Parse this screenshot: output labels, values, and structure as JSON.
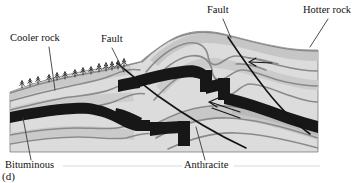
{
  "figure": {
    "panel_id": "(d)",
    "width": 363,
    "height": 183,
    "background": "#ffffff"
  },
  "labels": {
    "cooler_rock": "Cooler rock",
    "fault_left": "Fault",
    "fault_top": "Fault",
    "hotter_rock": "Hotter rock",
    "bituminous": "Bituminous",
    "anthracite": "Anthracite"
  },
  "colors": {
    "coal_seam": "#171717",
    "rock_light": "#dcdcdc",
    "rock_mid": "#c8c8c8",
    "rock_dark": "#b4b4b4",
    "stratum_line": "#8a8a8a",
    "fault_line": "#141414",
    "leader_line": "#3a3a3a",
    "tree": "#2a2a2a",
    "text": "#111111"
  },
  "diagram": {
    "type": "geologic-cross-section",
    "block_extent": {
      "x": 10,
      "y": 30,
      "width": 308,
      "height": 122
    },
    "features": [
      {
        "name": "coal-seam",
        "rank_left": "Bituminous",
        "rank_right": "Anthracite"
      },
      {
        "name": "fault-left",
        "kind": "reverse-fault"
      },
      {
        "name": "fault-right",
        "kind": "reverse-fault",
        "slip_arrows": 2
      },
      {
        "name": "ground-surface-vegetation",
        "tree_count": 14
      }
    ]
  },
  "leaders": {
    "cooler_rock": {
      "x1": 49,
      "y1": 47,
      "x2": 55,
      "y2": 90
    },
    "fault_left": {
      "x1": 112,
      "y1": 48,
      "x2": 124,
      "y2": 72
    },
    "fault_top": {
      "x1": 223,
      "y1": 19,
      "x2": 231,
      "y2": 38
    },
    "hotter_rock": {
      "x1": 328,
      "y1": 19,
      "x2": 310,
      "y2": 47
    },
    "bituminous": {
      "x1": 31,
      "y1": 160,
      "x2": 23,
      "y2": 118
    },
    "anthracite": {
      "x1": 205,
      "y1": 160,
      "x2": 196,
      "y2": 127
    }
  }
}
